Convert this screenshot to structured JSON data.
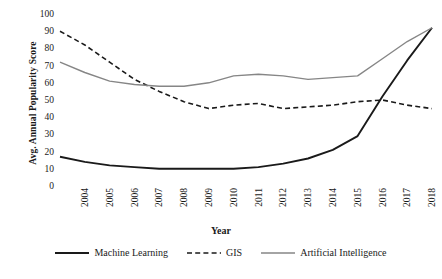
{
  "chart_data": {
    "type": "line",
    "title": "",
    "xlabel": "Year",
    "ylabel": "Avg. Annual Popularity Score",
    "x": [
      2004,
      2005,
      2006,
      2007,
      2008,
      2009,
      2010,
      2011,
      2012,
      2013,
      2014,
      2015,
      2016,
      2017,
      2018,
      2019
    ],
    "categories": [
      "2004",
      "2005",
      "2006",
      "2007",
      "2008",
      "2009",
      "2010",
      "2011",
      "2012",
      "2013",
      "2014",
      "2015",
      "2016",
      "2017",
      "2018",
      "2019"
    ],
    "xlim": [
      2004,
      2019
    ],
    "ylim": [
      0,
      100
    ],
    "yticks": [
      0,
      10,
      20,
      30,
      40,
      50,
      60,
      70,
      80,
      90,
      100
    ],
    "ytick_labels": [
      "0",
      "10",
      "20",
      "30",
      "40",
      "50",
      "60",
      "70",
      "80",
      "90",
      "100"
    ],
    "grid": false,
    "legend_position": "bottom",
    "series": [
      {
        "name": "Machine Learning",
        "color": "#1a1a1a",
        "style": "solid",
        "width": 1.9,
        "values": [
          17,
          14,
          12,
          11,
          10,
          10,
          10,
          10,
          11,
          13,
          16,
          21,
          29,
          52,
          73,
          92
        ]
      },
      {
        "name": "GIS",
        "color": "#1a1a1a",
        "style": "dashed",
        "width": 1.6,
        "values": [
          90,
          82,
          72,
          62,
          55,
          49,
          45,
          47,
          48,
          45,
          46,
          47,
          49,
          50,
          47,
          45
        ]
      },
      {
        "name": "Artificial Intelligence",
        "color": "#868686",
        "style": "solid",
        "width": 1.4,
        "values": [
          72,
          66,
          61,
          59,
          58,
          58,
          60,
          64,
          65,
          64,
          62,
          63,
          64,
          74,
          84,
          92
        ]
      }
    ]
  },
  "legend": {
    "items": [
      {
        "label": "Machine Learning"
      },
      {
        "label": "GIS"
      },
      {
        "label": "Artificial Intelligence"
      }
    ]
  }
}
